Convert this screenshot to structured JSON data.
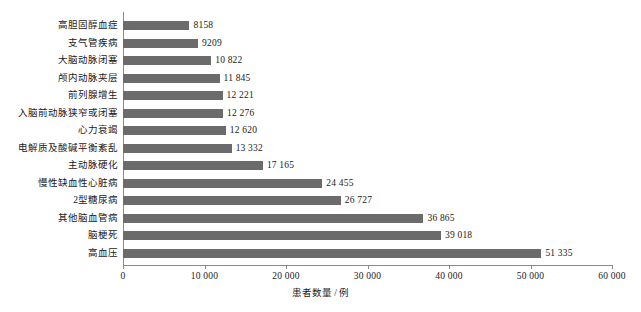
{
  "chart_data": {
    "type": "bar",
    "orientation": "horizontal",
    "title": "",
    "xlabel": "患者数量 / 例",
    "ylabel": "",
    "xlim": [
      0,
      60000
    ],
    "xticks": [
      0,
      10000,
      20000,
      30000,
      40000,
      50000,
      60000
    ],
    "xtick_labels": [
      "0",
      "10 000",
      "20 000",
      "30 000",
      "40 000",
      "50 000",
      "60 000"
    ],
    "grid": false,
    "legend": "none",
    "bar_color": "#6b6b6b",
    "axis_color": "#8a8a8a",
    "categories": [
      "高胆固醇血症",
      "支气管疾病",
      "大脑动脉闭塞",
      "颅内动脉夹层",
      "前列腺增生",
      "入脑前动脉狭窄或闭塞",
      "心力衰竭",
      "电解质及酸碱平衡紊乱",
      "主动脉硬化",
      "慢性缺血性心脏病",
      "2型糖尿病",
      "其他脑血管病",
      "脑梗死",
      "高血压"
    ],
    "values": [
      8158,
      9209,
      10822,
      11845,
      12221,
      12276,
      12620,
      13332,
      17165,
      24455,
      26727,
      36865,
      39018,
      51335
    ],
    "value_labels": [
      "8158",
      "9209",
      "10 822",
      "11 845",
      "12 221",
      "12 276",
      "12 620",
      "13 332",
      "17 165",
      "24 455",
      "26 727",
      "36 865",
      "39 018",
      "51 335"
    ]
  },
  "caption": {
    "text": ""
  }
}
